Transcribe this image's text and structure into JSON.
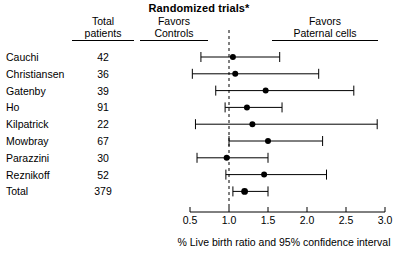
{
  "title": "Randomized trials*",
  "headers": {
    "total_patients": [
      "Total",
      "patients"
    ],
    "favors_controls": [
      "Favors",
      "Controls"
    ],
    "favors_paternal": [
      "Favors",
      "Paternal cells"
    ]
  },
  "axis_caption": "% Live birth ratio and 95% confidence interval",
  "colors": {
    "line": "#000000",
    "marker": "#000000",
    "background": "#ffffff",
    "reference": "#000000"
  },
  "chart_data": {
    "type": "forest",
    "title": "Randomized trials*",
    "xlabel": "% Live birth ratio and 95% confidence interval",
    "ylabel": "",
    "xlim": [
      0.5,
      3.0
    ],
    "xticks": [
      0.5,
      1.0,
      1.5,
      2.0,
      2.5,
      3.0
    ],
    "xticklabels": [
      "0.5",
      "1.0",
      "1.5",
      "2.0",
      "2.5",
      "3.0"
    ],
    "reference_line": 1.0,
    "grid": false,
    "legend": null,
    "columns": [
      "Study",
      "Total patients",
      "Live birth ratio",
      "95% CI lower",
      "95% CI upper"
    ],
    "rows": [
      {
        "study": "Cauchi",
        "total_patients": 42,
        "estimate": 1.05,
        "ci_low": 0.64,
        "ci_high": 1.65,
        "is_total": false
      },
      {
        "study": "Christiansen",
        "total_patients": 36,
        "estimate": 1.08,
        "ci_low": 0.53,
        "ci_high": 2.15,
        "is_total": false
      },
      {
        "study": "Gatenby",
        "total_patients": 39,
        "estimate": 1.47,
        "ci_low": 0.83,
        "ci_high": 2.6,
        "is_total": false
      },
      {
        "study": "Ho",
        "total_patients": 91,
        "estimate": 1.23,
        "ci_low": 0.95,
        "ci_high": 1.68,
        "is_total": false
      },
      {
        "study": "Kilpatrick",
        "total_patients": 22,
        "estimate": 1.3,
        "ci_low": 0.57,
        "ci_high": 2.9,
        "is_total": false
      },
      {
        "study": "Mowbray",
        "total_patients": 67,
        "estimate": 1.5,
        "ci_low": 1.0,
        "ci_high": 2.2,
        "is_total": false
      },
      {
        "study": "Parazzini",
        "total_patients": 30,
        "estimate": 0.97,
        "ci_low": 0.59,
        "ci_high": 1.5,
        "is_total": false
      },
      {
        "study": "Reznikoff",
        "total_patients": 52,
        "estimate": 1.45,
        "ci_low": 0.96,
        "ci_high": 2.25,
        "is_total": false
      },
      {
        "study": "Total",
        "total_patients": 379,
        "estimate": 1.2,
        "ci_low": 1.05,
        "ci_high": 1.5,
        "is_total": true
      }
    ]
  }
}
